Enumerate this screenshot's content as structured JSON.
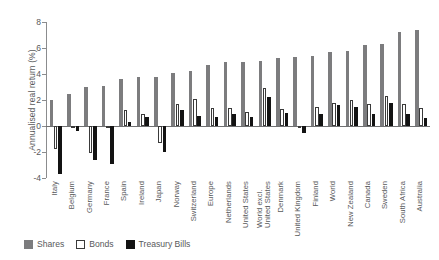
{
  "chart_data": {
    "type": "bar",
    "title": "",
    "xlabel": "",
    "ylabel": "Annualised real return (%)",
    "ylim": [
      -4,
      8
    ],
    "yticks": [
      8,
      6,
      4,
      2,
      0,
      -2,
      -4
    ],
    "grid": false,
    "legend_position": "bottom-left",
    "categories": [
      "Italy",
      "Belgium",
      "Germany",
      "France",
      "Spain",
      "Ireland",
      "Japan",
      "Norway",
      "Switzerland",
      "Europe",
      "Netherlands",
      "United States",
      "World excl. United States",
      "Denmark",
      "United Kingdom",
      "Finland",
      "World",
      "New Zealand",
      "Canada",
      "Sweden",
      "South Africa",
      "Australia"
    ],
    "series": [
      {
        "name": "Shares",
        "color": "#7c7c7e",
        "values": [
          2.0,
          2.5,
          3.0,
          3.1,
          3.6,
          3.8,
          4.1,
          4.2,
          4.8,
          4.9,
          4.9,
          5.0,
          5.2,
          5.3,
          5.4,
          5.7,
          5.8,
          6.2,
          6.3,
          7.2,
          7.4,
          4.7
        ]
      },
      {
        "name": "Bonds",
        "color": "#ffffff",
        "values": [
          -1.8,
          -0.1,
          -2.1,
          -0.1,
          1.2,
          0.9,
          -1.3,
          1.7,
          2.1,
          1.4,
          1.1,
          1.3,
          2.9,
          1.3,
          1.5,
          1.8,
          2.0,
          1.7,
          2.3,
          1.7,
          1.4,
          0.7
        ]
      },
      {
        "name": "Treasury Bills",
        "color": "#131313",
        "values": [
          -3.7,
          -0.4,
          -2.6,
          -2.9,
          0.3,
          0.7,
          -2.0,
          1.2,
          0.8,
          0.7,
          0.9,
          0.7,
          2.2,
          1.0,
          -0.5,
          1.6,
          1.5,
          0.9,
          1.8,
          0.9,
          0.6,
          0.8
        ]
      }
    ],
    "data_by_category": [
      {
        "category": "Italy",
        "shares": 2.0,
        "bonds": -1.8,
        "bills": -3.7
      },
      {
        "category": "Belgium",
        "shares": 2.5,
        "bonds": -0.1,
        "bills": -0.4
      },
      {
        "category": "Germany",
        "shares": 3.0,
        "bonds": -2.1,
        "bills": -2.6
      },
      {
        "category": "France",
        "shares": 3.1,
        "bonds": -0.1,
        "bills": -2.9
      },
      {
        "category": "Spain",
        "shares": 3.6,
        "bonds": 1.2,
        "bills": 0.3
      },
      {
        "category": "Ireland",
        "shares": 3.8,
        "bonds": 0.9,
        "bills": 0.7
      },
      {
        "category": "Japan",
        "shares": 3.8,
        "bonds": -1.3,
        "bills": -2.0
      },
      {
        "category": "Norway",
        "shares": 4.1,
        "bonds": 1.7,
        "bills": 1.2
      },
      {
        "category": "Switzerland",
        "shares": 4.2,
        "bonds": 2.1,
        "bills": 0.8
      },
      {
        "category": "Europe",
        "shares": 4.7,
        "bonds": 1.4,
        "bills": 0.7
      },
      {
        "category": "Netherlands",
        "shares": 4.9,
        "bonds": 1.4,
        "bills": 0.9
      },
      {
        "category": "United States",
        "shares": 4.9,
        "bonds": 1.1,
        "bills": 0.7
      },
      {
        "category": "World excl. United States",
        "shares": 5.0,
        "bonds": 2.9,
        "bills": 2.2
      },
      {
        "category": "Denmark",
        "shares": 5.2,
        "bonds": 1.3,
        "bills": 1.0
      },
      {
        "category": "United Kingdom",
        "shares": 5.3,
        "bonds": 0.0,
        "bills": -0.5
      },
      {
        "category": "Finland",
        "shares": 5.4,
        "bonds": 1.5,
        "bills": 0.9
      },
      {
        "category": "World",
        "shares": 5.7,
        "bonds": 1.8,
        "bills": 1.6
      },
      {
        "category": "New Zealand",
        "shares": 5.8,
        "bonds": 2.0,
        "bills": 1.5
      },
      {
        "category": "Canada",
        "shares": 6.2,
        "bonds": 1.7,
        "bills": 0.9
      },
      {
        "category": "Sweden",
        "shares": 6.3,
        "bonds": 2.3,
        "bills": 1.8
      },
      {
        "category": "South Africa",
        "shares": 7.2,
        "bonds": 1.7,
        "bills": 0.9
      },
      {
        "category": "Australia",
        "shares": 7.4,
        "bonds": 1.4,
        "bills": 0.6
      }
    ]
  },
  "legend": {
    "items": [
      {
        "label": "Shares",
        "key": "shares"
      },
      {
        "label": "Bonds",
        "key": "bonds"
      },
      {
        "label": "Treasury Bills",
        "key": "bills"
      }
    ]
  }
}
